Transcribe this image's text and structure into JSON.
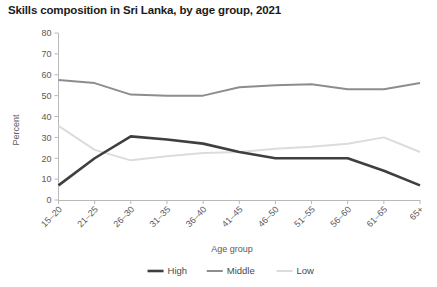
{
  "chart_data": {
    "type": "line",
    "title": "Skills composition in Sri Lanka, by age group, 2021",
    "xlabel": "Age group",
    "ylabel": "Percent",
    "categories": [
      "15–20",
      "21–25",
      "26–30",
      "31–35",
      "36–40",
      "41–45",
      "46–50",
      "51–55",
      "56–60",
      "61–65",
      "65+"
    ],
    "series": [
      {
        "name": "High",
        "color": "#3f3f3f",
        "width": 2.6,
        "values": [
          7,
          20,
          30.5,
          29,
          27,
          23,
          20,
          20,
          20,
          14,
          7
        ]
      },
      {
        "name": "Middle",
        "color": "#8d8d8d",
        "width": 2.0,
        "values": [
          57.5,
          56,
          50.5,
          50,
          50,
          54,
          55,
          55.5,
          53,
          53,
          56
        ]
      },
      {
        "name": "Low",
        "color": "#dcdcdc",
        "width": 2.0,
        "values": [
          35.5,
          24,
          19,
          21,
          22.5,
          23,
          24.5,
          25.5,
          27,
          30,
          23
        ]
      }
    ],
    "ylim": [
      0,
      80
    ],
    "yticks": [
      0,
      10,
      20,
      30,
      40,
      50,
      60,
      70,
      80
    ],
    "xlim_indices": [
      0,
      10
    ],
    "grid": false,
    "legend_position": "bottom"
  },
  "legend": {
    "items": [
      {
        "label": "High"
      },
      {
        "label": "Middle"
      },
      {
        "label": "Low"
      }
    ]
  }
}
